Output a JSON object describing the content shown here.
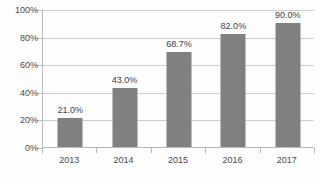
{
  "chart_data": {
    "type": "bar",
    "title": "",
    "subtitle": "",
    "xlabel": "",
    "ylabel": "",
    "categories": [
      "2013",
      "2014",
      "2015",
      "2016",
      "2017"
    ],
    "values": [
      21.0,
      43.0,
      68.7,
      82.0,
      90.0
    ],
    "data_labels": [
      "21.0%",
      "43.0%",
      "68.7%",
      "82.0%",
      "90.0%"
    ],
    "ylim": [
      0,
      100
    ],
    "ytick_values": [
      0,
      20,
      40,
      60,
      80,
      100
    ],
    "ytick_labels": [
      "0%",
      "20%",
      "40%",
      "60%",
      "80%",
      "100%"
    ],
    "grid": true,
    "legend": false,
    "legend_position": "none",
    "series": [
      {
        "name": "",
        "values": [
          21.0,
          43.0,
          68.7,
          82.0,
          90.0
        ]
      }
    ],
    "colors": {
      "bar": "#808080",
      "gridline": "#cfcfcf",
      "axis": "#b9b9b9",
      "tick_label": "#4a4a4a",
      "data_label": "#3f3f3f",
      "background": "#fdfdfd"
    }
  }
}
